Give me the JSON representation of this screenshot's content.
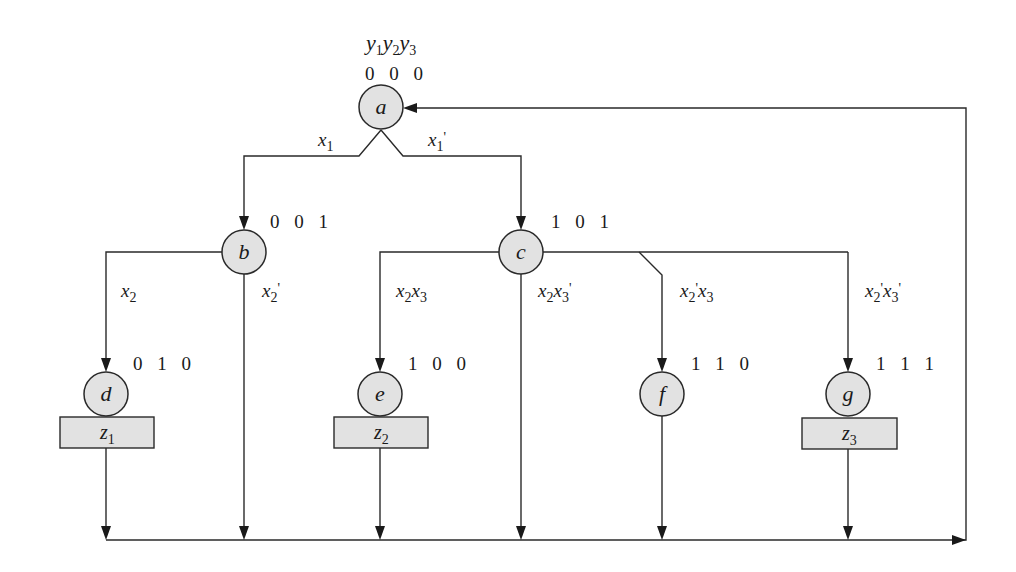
{
  "diagram": {
    "type": "ASM chart / state diagram",
    "state_vars_header": {
      "vars": [
        "y1",
        "y2",
        "y3"
      ]
    },
    "colors": {
      "node_fill": "#e2e2e2",
      "stroke": "#2a2a2a",
      "background": "#ffffff"
    },
    "states": [
      {
        "id": "a",
        "code": "0 0 0",
        "output": null
      },
      {
        "id": "b",
        "code": "0 0 1",
        "output": null
      },
      {
        "id": "c",
        "code": "1 0 1",
        "output": null
      },
      {
        "id": "d",
        "code": "0 1 0",
        "output": "z1"
      },
      {
        "id": "e",
        "code": "1 0 0",
        "output": "z2"
      },
      {
        "id": "f",
        "code": "1 1 0",
        "output": null
      },
      {
        "id": "g",
        "code": "1 1 1",
        "output": "z3"
      }
    ],
    "transitions": [
      {
        "from": "a",
        "to": "b",
        "condition": "x1"
      },
      {
        "from": "a",
        "to": "c",
        "condition": "x1'"
      },
      {
        "from": "b",
        "to": "d",
        "condition": "x2"
      },
      {
        "from": "b",
        "to": "a",
        "condition": "x2'"
      },
      {
        "from": "c",
        "to": "e",
        "condition": "x2x3"
      },
      {
        "from": "c",
        "to": "a",
        "condition": "x2x3'"
      },
      {
        "from": "c",
        "to": "f",
        "condition": "x2'x3"
      },
      {
        "from": "c",
        "to": "g",
        "condition": "x2'x3'"
      },
      {
        "from": "d",
        "to": "a",
        "condition": ""
      },
      {
        "from": "e",
        "to": "a",
        "condition": ""
      },
      {
        "from": "f",
        "to": "a",
        "condition": ""
      },
      {
        "from": "g",
        "to": "a",
        "condition": ""
      }
    ],
    "labels": {
      "a": "a",
      "b": "b",
      "c": "c",
      "d": "d",
      "e": "e",
      "f": "f",
      "g": "g",
      "code_a": "0 0 0",
      "code_b": "0 0 1",
      "code_c": "1 0 1",
      "code_d": "0 1 0",
      "code_e": "1 0 0",
      "code_f": "1 1 0",
      "code_g": "1 1 1",
      "z_letter": "z",
      "z1_sub": "1",
      "z2_sub": "2",
      "z3_sub": "3",
      "y_letter": "y",
      "y1_sub": "1",
      "y2_sub": "2",
      "y3_sub": "3",
      "x_letter": "x",
      "sub1": "1",
      "sub2": "2",
      "sub3": "3",
      "prime": "'"
    }
  }
}
